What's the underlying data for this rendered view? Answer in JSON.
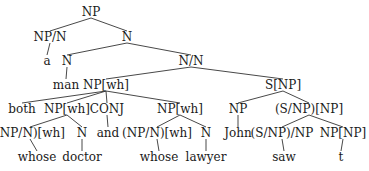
{
  "diagram": {
    "type": "syntax-tree",
    "nodes": [
      {
        "id": "n0",
        "label": "NP",
        "x": 91,
        "y": 12
      },
      {
        "id": "n1",
        "label": "NP/N",
        "x": 50,
        "y": 37
      },
      {
        "id": "n2",
        "label": "N",
        "x": 127,
        "y": 37
      },
      {
        "id": "n3",
        "label": "a",
        "x": 47,
        "y": 61
      },
      {
        "id": "n4",
        "label": "N",
        "x": 67,
        "y": 61
      },
      {
        "id": "n5",
        "label": "N/N",
        "x": 191,
        "y": 61
      },
      {
        "id": "n6",
        "label": "man",
        "x": 66,
        "y": 85
      },
      {
        "id": "n7",
        "label": "NP[wh]",
        "x": 106,
        "y": 85
      },
      {
        "id": "n8",
        "label": "S[NP]",
        "x": 283,
        "y": 85
      },
      {
        "id": "n9",
        "label": "both",
        "x": 22,
        "y": 109
      },
      {
        "id": "n10",
        "label": "NP[wh]",
        "x": 67,
        "y": 109
      },
      {
        "id": "n11",
        "label": "CONJ",
        "x": 107,
        "y": 109
      },
      {
        "id": "n12",
        "label": "NP[wh]",
        "x": 180,
        "y": 109
      },
      {
        "id": "n13",
        "label": "NP",
        "x": 238,
        "y": 109
      },
      {
        "id": "n14",
        "label": "(S/NP)[NP]",
        "x": 309,
        "y": 109
      },
      {
        "id": "n15",
        "label": "(NP/N)[wh]",
        "x": 30,
        "y": 133
      },
      {
        "id": "n16",
        "label": "N",
        "x": 82,
        "y": 133
      },
      {
        "id": "n17",
        "label": "and",
        "x": 108,
        "y": 133
      },
      {
        "id": "n18",
        "label": "(NP/N)[wh]",
        "x": 157,
        "y": 133
      },
      {
        "id": "n19",
        "label": "N",
        "x": 206,
        "y": 133
      },
      {
        "id": "n20",
        "label": "John",
        "x": 238,
        "y": 133
      },
      {
        "id": "n21",
        "label": "(S/NP)/NP",
        "x": 282,
        "y": 133
      },
      {
        "id": "n22",
        "label": "NP[NP]",
        "x": 343,
        "y": 133
      },
      {
        "id": "n23",
        "label": "whose",
        "x": 37,
        "y": 157
      },
      {
        "id": "n24",
        "label": "doctor",
        "x": 82,
        "y": 157
      },
      {
        "id": "n25",
        "label": "whose",
        "x": 159,
        "y": 157
      },
      {
        "id": "n26",
        "label": "lawyer",
        "x": 206,
        "y": 157
      },
      {
        "id": "n27",
        "label": "saw",
        "x": 284,
        "y": 157
      },
      {
        "id": "n28",
        "label": "t",
        "x": 341,
        "y": 157
      }
    ],
    "edges": [
      [
        "n0",
        "n1"
      ],
      [
        "n0",
        "n2"
      ],
      [
        "n1",
        "n3"
      ],
      [
        "n2",
        "n4"
      ],
      [
        "n2",
        "n5"
      ],
      [
        "n4",
        "n6"
      ],
      [
        "n5",
        "n7"
      ],
      [
        "n5",
        "n8"
      ],
      [
        "n7",
        "n9"
      ],
      [
        "n7",
        "n10"
      ],
      [
        "n7",
        "n11"
      ],
      [
        "n7",
        "n12"
      ],
      [
        "n8",
        "n13"
      ],
      [
        "n8",
        "n14"
      ],
      [
        "n10",
        "n15"
      ],
      [
        "n10",
        "n16"
      ],
      [
        "n11",
        "n17"
      ],
      [
        "n12",
        "n18"
      ],
      [
        "n12",
        "n19"
      ],
      [
        "n13",
        "n20"
      ],
      [
        "n14",
        "n21"
      ],
      [
        "n14",
        "n22"
      ],
      [
        "n15",
        "n23"
      ],
      [
        "n16",
        "n24"
      ],
      [
        "n18",
        "n25"
      ],
      [
        "n19",
        "n26"
      ],
      [
        "n21",
        "n27"
      ],
      [
        "n22",
        "n28"
      ]
    ]
  }
}
